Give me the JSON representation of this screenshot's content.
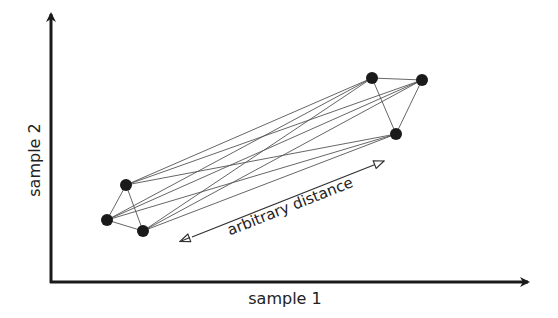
{
  "diagram": {
    "x_axis_label": "sample 1",
    "y_axis_label": "sample 2",
    "annotation": "arbitrary distance",
    "colors": {
      "axis": "#1a1a1a",
      "point": "#1a1a1a",
      "edge": "#555555",
      "text": "#222222"
    },
    "clusters": [
      {
        "name": "lower-left",
        "points": [
          [
            126,
            185
          ],
          [
            107,
            220
          ],
          [
            143,
            231
          ]
        ]
      },
      {
        "name": "upper-right",
        "points": [
          [
            372,
            78
          ],
          [
            422,
            80
          ],
          [
            396,
            134
          ]
        ]
      }
    ],
    "edges": "all pairwise connections within and between clusters"
  }
}
